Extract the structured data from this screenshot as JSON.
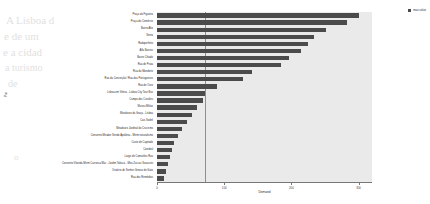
{
  "ghost_text": [
    {
      "t": "A Lisboa d",
      "x": 6,
      "y": 14,
      "s": 11
    },
    {
      "t": "e de um",
      "x": 4,
      "y": 30,
      "s": 11
    },
    {
      "t": "e a cidad",
      "x": 3,
      "y": 46,
      "s": 11
    },
    {
      "t": "a turismo",
      "x": 5,
      "y": 62,
      "s": 10
    },
    {
      "t": "de",
      "x": 8,
      "y": 78,
      "s": 10
    },
    {
      "t": "o",
      "x": 14,
      "y": 152,
      "s": 9
    }
  ],
  "legend": {
    "marker": "square-marker",
    "label": "max value"
  },
  "axes": {
    "xlabel": "Demand",
    "ylabel": "Poi",
    "xticks": [
      "0",
      "100",
      "200",
      "300"
    ],
    "xlim": [
      0,
      320
    ],
    "reference_line_value": 72
  },
  "chart_data": {
    "type": "bar",
    "orientation": "horizontal",
    "title": "",
    "xlabel": "Demand",
    "ylabel": "Poi",
    "xlim": [
      0,
      320
    ],
    "grid": false,
    "legend_position": "top-right",
    "bar_color": "#4b4b4b",
    "plot_background": "#eaeaea",
    "reference_line": 72,
    "categories": [
      "Praça do Figueira",
      "Praça do Comércio",
      "Bairro Alto",
      "Sintra",
      "Rodoperfeito",
      "Alfa Bairros",
      "Bairro Chiado",
      "Rua de Prata",
      "Rua do Mondeiro",
      "Rua da Conceição / Rua das Portugueses",
      "Rua de Ouro",
      "Lisboa em Vitória - Lisboa City Tour Bus",
      "Campo dos Cravões",
      "Museu Militar",
      "Miradouro da Graça - Lisboa",
      "Cais Sodré",
      "Miradouro Jardinal do Crucismo",
      "Convento Mirador Sendo Apolónia - Mirim naturalismo",
      "Custo de Capitado",
      "Catedral",
      "Largo de Camarões Rua",
      "Convento Vitanda Mirim Carrossa Mar - Jardim Tabuca - Mira Zuccas Sarassini",
      "Oratório de Senhor Ginoso de Gato",
      "Rua dos Remédios"
    ],
    "values": [
      300,
      283,
      252,
      234,
      225,
      215,
      196,
      185,
      142,
      128,
      90,
      72,
      68,
      60,
      52,
      45,
      37,
      31,
      26,
      22,
      19,
      16,
      13,
      10
    ]
  }
}
